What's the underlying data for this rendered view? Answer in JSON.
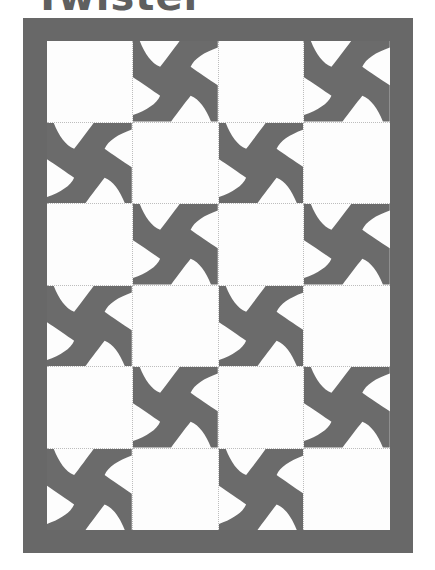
{
  "title": "Twister",
  "colors": {
    "border": "#686868",
    "pinwheel": "#6b6b6b",
    "background": "#fdfdfd",
    "grid_line": "#bdbdbd"
  },
  "quilt": {
    "rows": 6,
    "columns": 4,
    "block_icon": "pinwheel-icon",
    "layout": [
      [
        false,
        true,
        false,
        true
      ],
      [
        true,
        false,
        true,
        false
      ],
      [
        false,
        true,
        false,
        true
      ],
      [
        true,
        false,
        true,
        false
      ],
      [
        false,
        true,
        false,
        true
      ],
      [
        true,
        false,
        true,
        false
      ]
    ]
  }
}
